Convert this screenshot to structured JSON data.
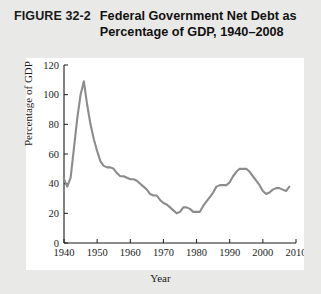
{
  "figure": {
    "label": "FIGURE 32-2",
    "title": "Federal Government Net Debt as Percentage of GDP, 1940–2008"
  },
  "chart_data": {
    "type": "line",
    "title": "Federal Government Net Debt as Percentage of GDP, 1940–2008",
    "xlabel": "Year",
    "ylabel": "Percentage of GDP",
    "xlim": [
      1940,
      2010
    ],
    "ylim": [
      0,
      120
    ],
    "xticks": [
      1940,
      1950,
      1960,
      1970,
      1980,
      1990,
      2000,
      2010
    ],
    "yticks": [
      0,
      20,
      40,
      60,
      80,
      100,
      120
    ],
    "xtick_labels": [
      "1940",
      "1950",
      "1960",
      "1970",
      "1980",
      "1990",
      "2000",
      "2010"
    ],
    "ytick_labels": [
      "0",
      "20",
      "40",
      "60",
      "80",
      "100",
      "120"
    ],
    "grid": false,
    "legend": false,
    "line_color": "#8c8c8c",
    "series": [
      {
        "name": "Federal government net debt (% of GDP)",
        "x": [
          1940,
          1941,
          1942,
          1943,
          1944,
          1945,
          1946,
          1947,
          1948,
          1949,
          1950,
          1951,
          1952,
          1953,
          1954,
          1955,
          1956,
          1957,
          1958,
          1959,
          1960,
          1961,
          1962,
          1963,
          1964,
          1965,
          1966,
          1967,
          1968,
          1969,
          1970,
          1971,
          1972,
          1973,
          1974,
          1975,
          1976,
          1977,
          1978,
          1979,
          1980,
          1981,
          1982,
          1983,
          1984,
          1985,
          1986,
          1987,
          1988,
          1989,
          1990,
          1991,
          1992,
          1993,
          1994,
          1995,
          1996,
          1997,
          1998,
          1999,
          2000,
          2001,
          2002,
          2003,
          2004,
          2005,
          2006,
          2007,
          2008
        ],
        "values": [
          43,
          38,
          44,
          64,
          84,
          100,
          109,
          93,
          80,
          70,
          62,
          55,
          52,
          51,
          51,
          50,
          47,
          45,
          45,
          44,
          43,
          43,
          42,
          40,
          38,
          36,
          33,
          32,
          32,
          29,
          27,
          26,
          24,
          22,
          20,
          21,
          24,
          24,
          23,
          21,
          21,
          21,
          25,
          28,
          31,
          34,
          38,
          39,
          39,
          39,
          41,
          45,
          48,
          50,
          50,
          50,
          48,
          45,
          42,
          39,
          35,
          33,
          34,
          36,
          37,
          37,
          36,
          35,
          38
        ],
        "key_points": [
          {
            "year": 1940,
            "value": 43,
            "note": "series start"
          },
          {
            "year": 1941,
            "value": 38,
            "note": "pre-war dip"
          },
          {
            "year": 1946,
            "value": 109,
            "note": "World War II peak"
          },
          {
            "year": 1974,
            "value": 15,
            "note": "post-war trough"
          },
          {
            "year": 1995,
            "value": 70,
            "note": "mid-1990s peak"
          },
          {
            "year": 2008,
            "value": 31,
            "note": "series end"
          }
        ]
      }
    ]
  }
}
